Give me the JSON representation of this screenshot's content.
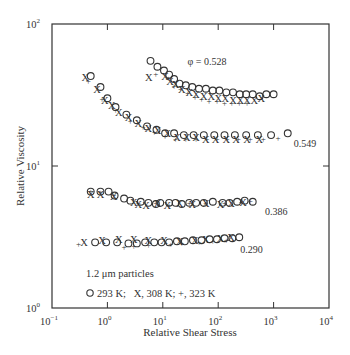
{
  "chart_data": {
    "type": "scatter",
    "title": "",
    "xlabel": "Relative Shear Stress",
    "ylabel": "Relative Viscosity",
    "xscale": "log",
    "yscale": "log",
    "xlim": [
      0.1,
      10000
    ],
    "ylim": [
      1,
      100
    ],
    "grid": false,
    "x_ticks": [
      {
        "value": 0.1,
        "base": "10",
        "exp": "−1"
      },
      {
        "value": 1,
        "base": "10",
        "exp": "0"
      },
      {
        "value": 10,
        "base": "10",
        "exp": "1"
      },
      {
        "value": 100,
        "base": "10",
        "exp": "2"
      },
      {
        "value": 1000,
        "base": "10",
        "exp": "3"
      },
      {
        "value": 10000,
        "base": "10",
        "exp": "4"
      }
    ],
    "y_ticks": [
      {
        "value": 1,
        "base": "10",
        "exp": "0"
      },
      {
        "value": 10,
        "base": "10",
        "exp": "1"
      },
      {
        "value": 100,
        "base": "10",
        "exp": "2"
      }
    ],
    "legend": {
      "position": "lower-left inside",
      "title": "1.2 μm particles",
      "text": "293 K;   X, 308 K; +, 323 K",
      "entries": [
        {
          "marker": "o",
          "label": "293 K"
        },
        {
          "marker": "x",
          "label": "308 K"
        },
        {
          "marker": "+",
          "label": "323 K"
        }
      ]
    },
    "series_groups": [
      {
        "phi": "0.528",
        "label": "φ = 0.528",
        "label_pos": {
          "x": 28,
          "y": 55
        },
        "series": [
          {
            "name": "293 K",
            "marker": "o",
            "x": [
              6.0,
              8.0,
              10.5,
              13,
              16,
              20,
              26,
              34,
              45,
              60,
              80,
              105,
              140,
              185,
              245,
              320,
              420,
              560,
              740,
              1000
            ],
            "y": [
              55,
              50,
              47,
              44,
              41,
              38,
              37,
              36,
              35,
              35,
              34,
              34,
              33,
              33,
              32,
              32,
              32,
              31,
              32,
              32
            ]
          },
          {
            "name": "308 K",
            "marker": "x",
            "x": [
              5.6,
              11,
              13.5,
              17,
              22,
              30,
              40,
              55,
              75,
              100,
              135,
              185,
              250,
              330,
              450,
              600
            ],
            "y": [
              42,
              43,
              40,
              38,
              35,
              33,
              32,
              31,
              31,
              30,
              30,
              29,
              29,
              29,
              29,
              30
            ]
          },
          {
            "name": "323 K",
            "marker": "+",
            "x": [
              7.5,
              12.5,
              16,
              21,
              28,
              38,
              50,
              68,
              95,
              130,
              175,
              240,
              330
            ],
            "y": [
              45,
              42,
              37,
              35,
              33,
              31,
              30,
              29,
              29,
              28,
              28,
              28,
              28
            ]
          }
        ]
      },
      {
        "phi": "0.549",
        "label": "0.549",
        "label_pos": {
          "x": 2300,
          "y": 14.5
        },
        "series": [
          {
            "name": "293 K",
            "marker": "o",
            "x": [
              0.5,
              0.75,
              1.0,
              1.4,
              2.2,
              3.4,
              5.2,
              7.7,
              11,
              16,
              24,
              36,
              55,
              85,
              130,
              200,
              320,
              520,
              900,
              1800
            ],
            "y": [
              43,
              36,
              30,
              26,
              23,
              21,
              19,
              18,
              17,
              17,
              16.5,
              16.5,
              16.5,
              16.5,
              16.5,
              16.5,
              16.5,
              16.5,
              16.5,
              17
            ]
          },
          {
            "name": "308 K",
            "marker": "x",
            "x": [
              0.4,
              0.65,
              0.9,
              1.2,
              1.6,
              2.4,
              3.6,
              5.5,
              8,
              12,
              18,
              27,
              40,
              60,
              90,
              140,
              210,
              330,
              550
            ],
            "y": [
              42,
              35,
              29,
              27,
              24,
              22,
              20,
              18.5,
              18,
              17,
              16,
              16,
              16,
              15.5,
              15.5,
              15.5,
              15.5,
              15.5,
              15.5
            ]
          },
          {
            "name": "323 K",
            "marker": "+",
            "x": [
              0.45,
              0.8,
              1.4,
              2.6,
              4.4,
              7,
              11,
              17,
              26,
              40,
              62,
              95,
              145,
              230,
              380,
              650,
              1200
            ],
            "y": [
              40,
              30,
              25,
              21,
              19,
              17.5,
              16.5,
              15.5,
              15.5,
              15.5,
              15.5,
              15.5,
              15.5,
              15.5,
              15.5,
              15.5,
              16
            ]
          }
        ]
      },
      {
        "phi": "0.386",
        "label": "0.386",
        "label_pos": {
          "x": 700,
          "y": 4.8
        },
        "series": [
          {
            "name": "293 K",
            "marker": "o",
            "x": [
              0.5,
              0.75,
              1.05,
              1.35,
              2.0,
              2.6,
              4.0,
              5.5,
              7.5,
              9.0,
              13,
              17,
              22,
              30,
              40,
              55,
              80,
              120,
              160,
              220,
              300,
              420
            ],
            "y": [
              6.6,
              6.6,
              6.6,
              6.2,
              5.9,
              5.7,
              5.6,
              5.5,
              5.4,
              5.5,
              5.5,
              5.5,
              5.4,
              5.5,
              5.5,
              5.5,
              5.6,
              5.5,
              5.5,
              5.6,
              5.7,
              5.6
            ]
          },
          {
            "name": "308 K",
            "marker": "x",
            "x": [
              0.5,
              0.75,
              1.3,
              3.0,
              3.6,
              5.0,
              8,
              12,
              20,
              34,
              60,
              110,
              170,
              280
            ],
            "y": [
              6.4,
              6.4,
              6.1,
              5.6,
              5.4,
              5.3,
              5.5,
              5.3,
              5.5,
              5.4,
              5.5,
              5.4,
              5.5,
              5.6
            ]
          },
          {
            "name": "323 K",
            "marker": "+",
            "x": [
              0.5,
              0.75,
              1.3,
              3.6,
              7.5,
              13,
              30,
              60,
              130,
              260,
              380
            ],
            "y": [
              6.7,
              6.6,
              6.3,
              5.5,
              5.5,
              5.4,
              5.5,
              5.5,
              5.5,
              5.6,
              5.7
            ]
          }
        ]
      },
      {
        "phi": "0.290",
        "label": "0.290",
        "label_pos": {
          "x": 250,
          "y": 2.6
        },
        "series": [
          {
            "name": "293 K",
            "marker": "o",
            "x": [
              0.6,
              0.95,
              1.5,
              2.4,
              3.4,
              4.8,
              7,
              9.5,
              13,
              18,
              25,
              35,
              50,
              70,
              95,
              130,
              180,
              240
            ],
            "y": [
              2.9,
              2.9,
              2.9,
              2.85,
              2.85,
              2.9,
              2.9,
              2.9,
              2.9,
              2.95,
              2.95,
              3.0,
              3.0,
              3.05,
              3.05,
              3.1,
              3.1,
              3.15
            ]
          },
          {
            "name": "308 K",
            "marker": "x",
            "x": [
              0.38,
              0.8,
              1.6,
              3.0,
              5.5,
              10.5,
              20,
              38,
              60,
              110,
              170
            ],
            "y": [
              2.9,
              3.0,
              3.05,
              3.05,
              3.0,
              3.0,
              2.95,
              3.0,
              3.05,
              3.1,
              3.15
            ]
          },
          {
            "name": "323 K",
            "marker": "+",
            "x": [
              0.3,
              2.0,
              3.0,
              5.5,
              14,
              22,
              45,
              80,
              140
            ],
            "y": [
              2.85,
              2.7,
              2.75,
              2.8,
              2.85,
              2.9,
              2.95,
              3.0,
              3.05
            ]
          }
        ]
      }
    ]
  }
}
